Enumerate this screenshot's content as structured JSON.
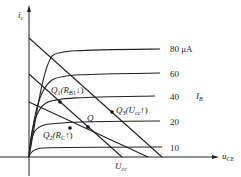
{
  "figure": {
    "y_axis_label": "i",
    "y_axis_sub": "c",
    "x_axis_label": "u",
    "x_axis_sub": "CE",
    "family_label": "I",
    "family_sub": "B",
    "supply_label": "U",
    "supply_sub": "cc"
  },
  "curves": [
    {
      "label": "80 μA",
      "ib": 80
    },
    {
      "label": "60",
      "ib": 60
    },
    {
      "label": "40",
      "ib": 40
    },
    {
      "label": "20",
      "ib": 20
    },
    {
      "label": "10",
      "ib": 10
    }
  ],
  "points": {
    "q": {
      "label": "Q"
    },
    "q1": {
      "label": "Q",
      "sub": "1",
      "note": "(R",
      "note_sub": "B1",
      "arrow": "↓)"
    },
    "q2": {
      "label": "Q",
      "sub": "2",
      "note": "(R",
      "note_sub": "C",
      "arrow": "↑)"
    },
    "q3": {
      "label": "Q",
      "sub": "3",
      "note": "(U",
      "note_sub": "cc",
      "arrow": "↑)"
    }
  },
  "colors": {
    "line": "#222222",
    "background": "#ffffff"
  }
}
